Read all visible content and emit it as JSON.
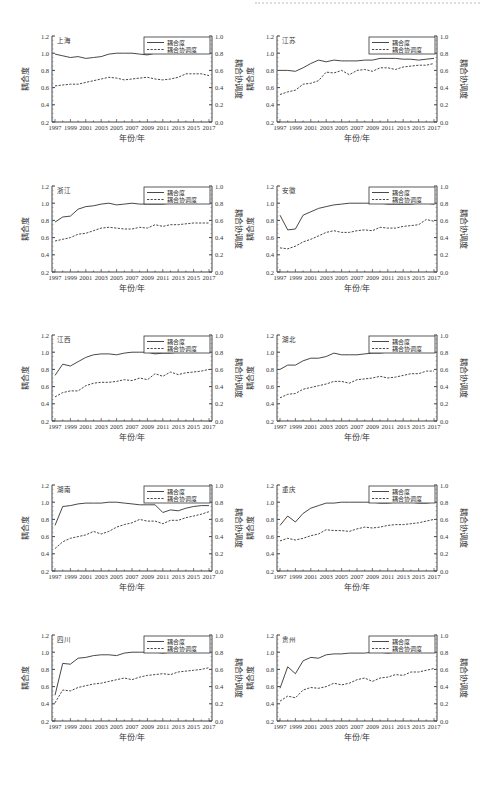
{
  "page": {
    "header_text": "",
    "years": [
      1997,
      1998,
      1999,
      2000,
      2001,
      2002,
      2003,
      2004,
      2005,
      2006,
      2007,
      2008,
      2009,
      2010,
      2011,
      2012,
      2013,
      2014,
      2015,
      2016,
      2017
    ]
  },
  "chart_data": [
    {
      "type": "line",
      "title": "上海",
      "xlabel": "年份/年",
      "ylabel": "耦合度",
      "y2label": "耦合协调度",
      "ylim": [
        0.2,
        1.2
      ],
      "y2lim": [
        0.0,
        1.0
      ],
      "xticks": [
        "1997",
        "1999",
        "2001",
        "2003",
        "2005",
        "2007",
        "2009",
        "2011",
        "2013",
        "2015",
        "2017"
      ],
      "yticks": [
        "0.2",
        "0.4",
        "0.6",
        "0.8",
        "1.0",
        "1.2"
      ],
      "y2ticks": [
        "0.0",
        "0.2",
        "0.4",
        "0.6",
        "0.8",
        "1.0"
      ],
      "legend": [
        "耦合度",
        "耦合协调度"
      ],
      "legend_position": "upper right",
      "grid": false,
      "series": [
        {
          "name": "耦合度",
          "axis": "left",
          "style": "solid",
          "values": [
            0.99,
            0.97,
            0.95,
            0.96,
            0.94,
            0.95,
            0.96,
            0.99,
            1.0,
            1.0,
            1.0,
            0.99,
            0.98,
            1.0,
            1.0,
            1.0,
            1.0,
            1.0,
            1.0,
            1.0,
            1.0
          ]
        },
        {
          "name": "耦合协调度",
          "axis": "right",
          "style": "dashed",
          "values": [
            0.42,
            0.43,
            0.44,
            0.44,
            0.46,
            0.48,
            0.5,
            0.52,
            0.51,
            0.49,
            0.5,
            0.51,
            0.52,
            0.5,
            0.49,
            0.5,
            0.52,
            0.56,
            0.56,
            0.56,
            0.54
          ]
        }
      ]
    },
    {
      "type": "line",
      "title": "江苏",
      "xlabel": "年份/年",
      "ylabel": "耦合度",
      "y2label": "耦合协调度",
      "ylim": [
        0.2,
        1.2
      ],
      "y2lim": [
        0.0,
        1.0
      ],
      "xticks": [
        "1997",
        "1999",
        "2001",
        "2003",
        "2005",
        "2007",
        "2009",
        "2011",
        "2013",
        "2015",
        "2017"
      ],
      "yticks": [
        "0.2",
        "0.4",
        "0.6",
        "0.8",
        "1.0",
        "1.2"
      ],
      "y2ticks": [
        "0.0",
        "0.2",
        "0.4",
        "0.6",
        "0.8",
        "1.0"
      ],
      "legend": [
        "耦合度",
        "耦合协调度"
      ],
      "legend_position": "upper right",
      "grid": false,
      "series": [
        {
          "name": "耦合度",
          "axis": "left",
          "style": "solid",
          "values": [
            0.8,
            0.8,
            0.79,
            0.83,
            0.88,
            0.92,
            0.9,
            0.92,
            0.91,
            0.91,
            0.91,
            0.92,
            0.92,
            0.94,
            0.94,
            0.94,
            0.93,
            0.93,
            0.92,
            0.93,
            0.94
          ]
        },
        {
          "name": "耦合协调度",
          "axis": "right",
          "style": "dashed",
          "values": [
            0.32,
            0.35,
            0.37,
            0.44,
            0.45,
            0.48,
            0.58,
            0.57,
            0.6,
            0.55,
            0.6,
            0.61,
            0.59,
            0.63,
            0.63,
            0.61,
            0.64,
            0.65,
            0.66,
            0.66,
            0.68
          ]
        }
      ]
    },
    {
      "type": "line",
      "title": "浙江",
      "xlabel": "年份/年",
      "ylabel": "耦合度",
      "y2label": "耦合协调度",
      "ylim": [
        0.2,
        1.2
      ],
      "y2lim": [
        0.0,
        1.0
      ],
      "xticks": [
        "1997",
        "1999",
        "2001",
        "2003",
        "2005",
        "2007",
        "2009",
        "2011",
        "2013",
        "2015",
        "2017"
      ],
      "yticks": [
        "0.2",
        "0.4",
        "0.6",
        "0.8",
        "1.0",
        "1.2"
      ],
      "y2ticks": [
        "0.0",
        "0.2",
        "0.4",
        "0.6",
        "0.8",
        "1.0"
      ],
      "legend": [
        "耦合度",
        "耦合协调度"
      ],
      "legend_position": "upper right",
      "grid": false,
      "series": [
        {
          "name": "耦合度",
          "axis": "left",
          "style": "solid",
          "values": [
            0.78,
            0.84,
            0.85,
            0.93,
            0.96,
            0.97,
            0.99,
            1.0,
            0.98,
            0.99,
            1.0,
            0.99,
            0.99,
            0.99,
            0.99,
            1.0,
            1.0,
            1.0,
            1.0,
            1.0,
            1.0
          ]
        },
        {
          "name": "耦合协调度",
          "axis": "right",
          "style": "dashed",
          "values": [
            0.36,
            0.38,
            0.4,
            0.44,
            0.45,
            0.48,
            0.51,
            0.52,
            0.51,
            0.5,
            0.5,
            0.52,
            0.51,
            0.55,
            0.53,
            0.55,
            0.55,
            0.56,
            0.57,
            0.57,
            0.57
          ]
        }
      ]
    },
    {
      "type": "line",
      "title": "安徽",
      "xlabel": "年份/年",
      "ylabel": "耦合度",
      "y2label": "耦合协调度",
      "ylim": [
        0.2,
        1.2
      ],
      "y2lim": [
        0.0,
        1.0
      ],
      "xticks": [
        "1997",
        "1999",
        "2001",
        "2003",
        "2005",
        "2007",
        "2009",
        "2011",
        "2013",
        "2015",
        "2017"
      ],
      "yticks": [
        "0.2",
        "0.4",
        "0.6",
        "0.8",
        "1.0",
        "1.2"
      ],
      "y2ticks": [
        "0.0",
        "0.2",
        "0.4",
        "0.6",
        "0.8",
        "1.0"
      ],
      "legend": [
        "耦合度",
        "耦合协调度"
      ],
      "legend_position": "upper right",
      "grid": false,
      "series": [
        {
          "name": "耦合度",
          "axis": "left",
          "style": "solid",
          "values": [
            0.86,
            0.69,
            0.7,
            0.86,
            0.9,
            0.94,
            0.96,
            0.98,
            0.99,
            1.0,
            1.0,
            1.0,
            1.0,
            1.0,
            0.99,
            0.99,
            0.99,
            0.99,
            1.0,
            1.0,
            0.99
          ]
        },
        {
          "name": "耦合协调度",
          "axis": "right",
          "style": "dashed",
          "values": [
            0.28,
            0.27,
            0.3,
            0.35,
            0.38,
            0.42,
            0.46,
            0.48,
            0.46,
            0.46,
            0.48,
            0.49,
            0.48,
            0.52,
            0.51,
            0.51,
            0.53,
            0.54,
            0.55,
            0.61,
            0.59
          ]
        }
      ]
    },
    {
      "type": "line",
      "title": "江西",
      "xlabel": "年份/年",
      "ylabel": "耦合度",
      "y2label": "耦合协调度",
      "ylim": [
        0.2,
        1.2
      ],
      "y2lim": [
        0.0,
        1.0
      ],
      "xticks": [
        "1997",
        "1999",
        "2001",
        "2003",
        "2005",
        "2007",
        "2009",
        "2011",
        "2013",
        "2015",
        "2017"
      ],
      "yticks": [
        "0.2",
        "0.4",
        "0.6",
        "0.8",
        "1.0",
        "1.2"
      ],
      "y2ticks": [
        "0.0",
        "0.2",
        "0.4",
        "0.6",
        "0.8",
        "1.0"
      ],
      "legend": [
        "耦合度",
        "耦合协调度"
      ],
      "legend_position": "upper right",
      "grid": false,
      "series": [
        {
          "name": "耦合度",
          "axis": "left",
          "style": "solid",
          "values": [
            0.73,
            0.86,
            0.84,
            0.89,
            0.94,
            0.97,
            0.98,
            0.98,
            0.97,
            0.99,
            1.0,
            1.0,
            1.0,
            0.98,
            0.99,
            0.99,
            1.0,
            1.0,
            1.0,
            1.0,
            1.0
          ]
        },
        {
          "name": "耦合协调度",
          "axis": "right",
          "style": "dashed",
          "values": [
            0.28,
            0.33,
            0.35,
            0.35,
            0.41,
            0.44,
            0.45,
            0.45,
            0.46,
            0.48,
            0.47,
            0.5,
            0.48,
            0.55,
            0.52,
            0.57,
            0.54,
            0.56,
            0.57,
            0.58,
            0.6
          ]
        }
      ]
    },
    {
      "type": "line",
      "title": "湖北",
      "xlabel": "年份/年",
      "ylabel": "耦合度",
      "y2label": "耦合协调度",
      "ylim": [
        0.2,
        1.2
      ],
      "y2lim": [
        0.0,
        1.0
      ],
      "xticks": [
        "1997",
        "1999",
        "2001",
        "2003",
        "2005",
        "2007",
        "2009",
        "2011",
        "2013",
        "2015",
        "2017"
      ],
      "yticks": [
        "0.2",
        "0.4",
        "0.6",
        "0.8",
        "1.0",
        "1.2"
      ],
      "y2ticks": [
        "0.0",
        "0.2",
        "0.4",
        "0.6",
        "0.8",
        "1.0"
      ],
      "legend": [
        "耦合度",
        "耦合协调度"
      ],
      "legend_position": "upper right",
      "grid": false,
      "series": [
        {
          "name": "耦合度",
          "axis": "left",
          "style": "solid",
          "values": [
            0.8,
            0.85,
            0.85,
            0.9,
            0.93,
            0.93,
            0.95,
            0.99,
            0.97,
            0.97,
            0.97,
            0.98,
            0.99,
            0.99,
            1.0,
            1.0,
            1.0,
            1.0,
            1.0,
            1.0,
            1.0
          ]
        },
        {
          "name": "耦合协调度",
          "axis": "right",
          "style": "dashed",
          "values": [
            0.27,
            0.31,
            0.32,
            0.37,
            0.39,
            0.41,
            0.43,
            0.46,
            0.46,
            0.44,
            0.48,
            0.49,
            0.5,
            0.52,
            0.5,
            0.51,
            0.53,
            0.55,
            0.55,
            0.58,
            0.58
          ]
        }
      ]
    },
    {
      "type": "line",
      "title": "湖南",
      "xlabel": "年份/年",
      "ylabel": "耦合度",
      "y2label": "耦合协调度",
      "ylim": [
        0.2,
        1.2
      ],
      "y2lim": [
        0.0,
        1.0
      ],
      "xticks": [
        "1997",
        "1999",
        "2001",
        "2003",
        "2005",
        "2007",
        "2009",
        "2011",
        "2013",
        "2015",
        "2017"
      ],
      "yticks": [
        "0.2",
        "0.4",
        "0.6",
        "0.8",
        "1.0",
        "1.2"
      ],
      "y2ticks": [
        "0.0",
        "0.2",
        "0.4",
        "0.6",
        "0.8",
        "1.0"
      ],
      "legend": [
        "耦合度",
        "耦合协调度"
      ],
      "legend_position": "upper right",
      "grid": false,
      "series": [
        {
          "name": "耦合度",
          "axis": "left",
          "style": "solid",
          "values": [
            0.73,
            0.95,
            0.96,
            0.98,
            0.99,
            0.99,
            0.99,
            1.0,
            1.0,
            0.99,
            0.98,
            0.97,
            0.97,
            0.97,
            0.88,
            0.91,
            0.9,
            0.93,
            0.95,
            0.96,
            0.96
          ]
        },
        {
          "name": "耦合协调度",
          "axis": "right",
          "style": "dashed",
          "values": [
            0.26,
            0.34,
            0.38,
            0.4,
            0.42,
            0.46,
            0.43,
            0.46,
            0.51,
            0.54,
            0.56,
            0.6,
            0.58,
            0.58,
            0.55,
            0.59,
            0.59,
            0.62,
            0.64,
            0.66,
            0.69
          ]
        }
      ]
    },
    {
      "type": "line",
      "title": "重庆",
      "xlabel": "年份/年",
      "ylabel": "耦合度",
      "y2label": "耦合协调度",
      "ylim": [
        0.2,
        1.2
      ],
      "y2lim": [
        0.0,
        1.0
      ],
      "xticks": [
        "1997",
        "1999",
        "2001",
        "2003",
        "2005",
        "2007",
        "2009",
        "2011",
        "2013",
        "2015",
        "2017"
      ],
      "yticks": [
        "0.2",
        "0.4",
        "0.6",
        "0.8",
        "1.0",
        "1.2"
      ],
      "y2ticks": [
        "0.0",
        "0.2",
        "0.4",
        "0.6",
        "0.8",
        "1.0"
      ],
      "legend": [
        "耦合度",
        "耦合协调度"
      ],
      "legend_position": "upper right",
      "grid": false,
      "series": [
        {
          "name": "耦合度",
          "axis": "left",
          "style": "solid",
          "values": [
            0.73,
            0.84,
            0.77,
            0.87,
            0.93,
            0.96,
            0.99,
            0.99,
            1.0,
            1.0,
            1.0,
            1.0,
            1.0,
            0.99,
            0.99,
            1.0,
            1.0,
            1.0,
            0.99,
            0.99,
            1.0
          ]
        },
        {
          "name": "耦合协调度",
          "axis": "right",
          "style": "dashed",
          "values": [
            0.35,
            0.38,
            0.36,
            0.38,
            0.41,
            0.43,
            0.48,
            0.47,
            0.47,
            0.46,
            0.49,
            0.51,
            0.5,
            0.51,
            0.53,
            0.54,
            0.54,
            0.55,
            0.56,
            0.58,
            0.6
          ]
        }
      ]
    },
    {
      "type": "line",
      "title": "四川",
      "xlabel": "年份/年",
      "ylabel": "耦合度",
      "y2label": "耦合协调度",
      "ylim": [
        0.2,
        1.2
      ],
      "y2lim": [
        0.0,
        1.0
      ],
      "xticks": [
        "1997",
        "1999",
        "2001",
        "2003",
        "2005",
        "2007",
        "2009",
        "2011",
        "2013",
        "2015",
        "2017"
      ],
      "yticks": [
        "0.2",
        "0.4",
        "0.6",
        "0.8",
        "1.0",
        "1.2"
      ],
      "y2ticks": [
        "0.0",
        "0.2",
        "0.4",
        "0.6",
        "0.8",
        "1.0"
      ],
      "legend": [
        "耦合度",
        "耦合协调度"
      ],
      "legend_position": "upper right",
      "grid": false,
      "series": [
        {
          "name": "耦合度",
          "axis": "left",
          "style": "solid",
          "values": [
            0.5,
            0.87,
            0.86,
            0.93,
            0.94,
            0.96,
            0.97,
            0.97,
            0.96,
            0.99,
            1.0,
            1.0,
            1.0,
            1.0,
            0.99,
            1.0,
            1.0,
            1.0,
            1.0,
            1.0,
            1.0
          ]
        },
        {
          "name": "耦合协调度",
          "axis": "right",
          "style": "dashed",
          "values": [
            0.21,
            0.36,
            0.35,
            0.39,
            0.41,
            0.43,
            0.44,
            0.46,
            0.48,
            0.5,
            0.48,
            0.51,
            0.53,
            0.54,
            0.55,
            0.54,
            0.57,
            0.58,
            0.59,
            0.6,
            0.62
          ]
        }
      ]
    },
    {
      "type": "line",
      "title": "贵州",
      "xlabel": "年份/年",
      "ylabel": "耦合度",
      "y2label": "耦合协调度",
      "ylim": [
        0.2,
        1.2
      ],
      "y2lim": [
        0.0,
        1.0
      ],
      "xticks": [
        "1997",
        "1999",
        "2001",
        "2003",
        "2005",
        "2007",
        "2009",
        "2011",
        "2013",
        "2015",
        "2017"
      ],
      "yticks": [
        "0.2",
        "0.4",
        "0.6",
        "0.8",
        "1.0",
        "1.2"
      ],
      "y2ticks": [
        "0.0",
        "0.2",
        "0.4",
        "0.6",
        "0.8",
        "1.0"
      ],
      "legend": [
        "耦合度",
        "耦合协调度"
      ],
      "legend_position": "upper right",
      "grid": false,
      "series": [
        {
          "name": "耦合度",
          "axis": "left",
          "style": "solid",
          "values": [
            0.58,
            0.83,
            0.75,
            0.9,
            0.94,
            0.93,
            0.97,
            0.98,
            0.98,
            0.99,
            0.99,
            0.99,
            1.0,
            1.0,
            0.99,
            1.0,
            1.0,
            1.0,
            1.0,
            1.0,
            1.0
          ]
        },
        {
          "name": "耦合协调度",
          "axis": "right",
          "style": "dashed",
          "values": [
            0.23,
            0.29,
            0.27,
            0.36,
            0.39,
            0.38,
            0.4,
            0.44,
            0.42,
            0.44,
            0.48,
            0.5,
            0.46,
            0.5,
            0.51,
            0.54,
            0.53,
            0.57,
            0.57,
            0.59,
            0.61
          ]
        }
      ]
    }
  ]
}
